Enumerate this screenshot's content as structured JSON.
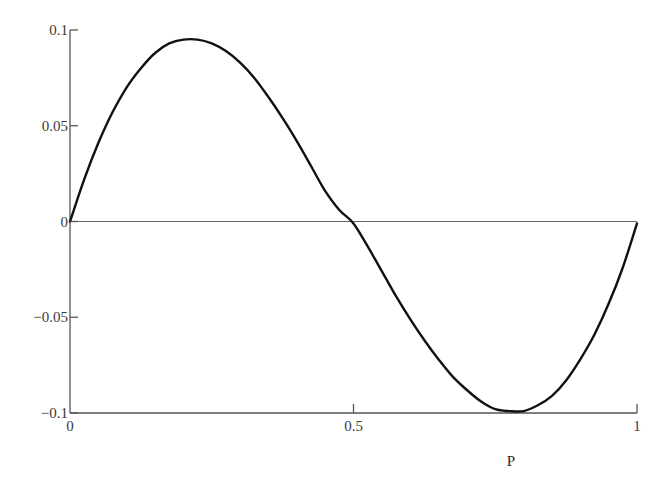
{
  "chart_data": {
    "type": "line",
    "title": "",
    "xlabel": "P",
    "ylabel": "",
    "xlim": [
      0,
      1
    ],
    "ylim": [
      -0.1,
      0.1
    ],
    "grid": false,
    "legend": null,
    "x_ticks": [
      0,
      0.5,
      1
    ],
    "x_tick_labels": [
      "0",
      "0.5",
      "1"
    ],
    "y_ticks": [
      0.1,
      0.05,
      0,
      -0.05,
      -0.1
    ],
    "y_tick_labels": [
      "0.1",
      "0.05",
      "0",
      "−0.05",
      "−0.1"
    ],
    "reference_lines": [
      {
        "axis": "y",
        "value": 0
      }
    ],
    "series": [
      {
        "name": "curve",
        "color": "#111111",
        "x": [
          0,
          0.025,
          0.05,
          0.075,
          0.1,
          0.125,
          0.15,
          0.175,
          0.2,
          0.225,
          0.25,
          0.275,
          0.3,
          0.325,
          0.35,
          0.375,
          0.4,
          0.425,
          0.45,
          0.475,
          0.5,
          0.525,
          0.55,
          0.575,
          0.6,
          0.625,
          0.65,
          0.675,
          0.7,
          0.725,
          0.75,
          0.775,
          0.8,
          0.825,
          0.85,
          0.875,
          0.9,
          0.925,
          0.95,
          0.975,
          1.0
        ],
        "values": [
          0,
          0.022,
          0.041,
          0.057,
          0.07,
          0.08,
          0.088,
          0.093,
          0.095,
          0.095,
          0.093,
          0.089,
          0.083,
          0.075,
          0.065,
          0.054,
          0.042,
          0.029,
          0.016,
          0.006,
          -0.001,
          -0.013,
          -0.026,
          -0.039,
          -0.051,
          -0.062,
          -0.072,
          -0.081,
          -0.088,
          -0.094,
          -0.098,
          -0.099,
          -0.099,
          -0.096,
          -0.091,
          -0.083,
          -0.072,
          -0.059,
          -0.043,
          -0.024,
          -0.001
        ]
      }
    ]
  },
  "axes": {
    "x_label": "P",
    "x_ticks": [
      "0",
      "0.5",
      "1"
    ],
    "y_ticks": [
      "0.1",
      "0.05",
      "0",
      "−0.05",
      "−0.1"
    ]
  }
}
